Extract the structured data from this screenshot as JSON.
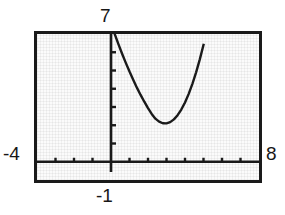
{
  "view": {
    "title": "Graphing calculator viewing window",
    "frame_color": "#1a1a1a",
    "screen_color": "#fbfbfb",
    "curve_color": "#1a1a1a"
  },
  "labels": {
    "ymax": "7",
    "ymin": "-1",
    "xmin": "-4",
    "xmax": "8"
  },
  "chart_data": {
    "type": "line",
    "title": "",
    "xlabel": "",
    "ylabel": "",
    "xlim": [
      -4,
      8
    ],
    "ylim": [
      -1,
      7
    ],
    "grid": false,
    "xtick_labels": [
      "-4",
      "8"
    ],
    "ytick_labels": [
      "7",
      "-1"
    ],
    "xticks": [
      -3,
      -2,
      -1,
      1,
      2,
      3,
      4,
      5,
      6,
      7
    ],
    "yticks": [
      1,
      2,
      3,
      4,
      5,
      6
    ],
    "axis_tick_spacing": 1,
    "annotations": [
      {
        "text": "7",
        "position": "above y-axis at top of window"
      },
      {
        "text": "-1",
        "position": "below y-axis at bottom of window"
      },
      {
        "text": "-4",
        "position": "left end of x-axis"
      },
      {
        "text": "8",
        "position": "right end of x-axis"
      }
    ],
    "series": [
      {
        "name": "curve",
        "shape": "parabola",
        "vertex": [
          2.9,
          2.1
        ],
        "x": [
          0.2,
          0.4,
          0.6,
          0.8,
          1.0,
          1.2,
          1.4,
          1.6,
          1.8,
          2.0,
          2.2,
          2.4,
          2.6,
          2.8,
          3.0,
          3.2,
          3.4,
          3.6,
          3.8,
          4.0,
          4.2,
          4.4,
          4.6,
          4.8,
          5.0
        ],
        "y": [
          7.0,
          6.45,
          5.92,
          5.42,
          4.94,
          4.49,
          4.06,
          3.66,
          3.29,
          2.94,
          2.62,
          2.36,
          2.2,
          2.11,
          2.1,
          2.17,
          2.32,
          2.55,
          2.86,
          3.25,
          3.72,
          4.27,
          4.9,
          5.61,
          6.4
        ],
        "clipped_top": true
      }
    ]
  }
}
